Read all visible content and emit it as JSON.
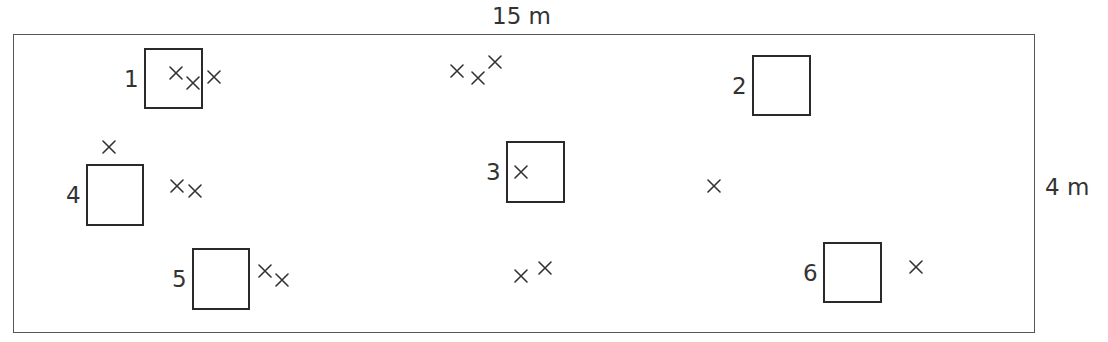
{
  "diagram": {
    "title": "",
    "colors": {
      "line": "#555555",
      "quadrat_border": "#2a2a2a",
      "text": "#333333",
      "background": "#ffffff"
    },
    "field": {
      "width_label": "15 m",
      "height_label": "4 m",
      "bounds_px": {
        "x": 13,
        "y": 34,
        "width": 1022,
        "height": 299
      }
    },
    "quadrats": [
      {
        "id": "1",
        "label": "1",
        "x": 144,
        "y": 48,
        "w": 59,
        "h": 61
      },
      {
        "id": "2",
        "label": "2",
        "x": 752,
        "y": 55,
        "w": 59,
        "h": 61
      },
      {
        "id": "3",
        "label": "3",
        "x": 506,
        "y": 141,
        "w": 59,
        "h": 62
      },
      {
        "id": "4",
        "label": "4",
        "x": 86,
        "y": 164,
        "w": 58,
        "h": 62
      },
      {
        "id": "5",
        "label": "5",
        "x": 192,
        "y": 248,
        "w": 58,
        "h": 62
      },
      {
        "id": "6",
        "label": "6",
        "x": 823,
        "y": 242,
        "w": 59,
        "h": 61
      }
    ],
    "marks": {
      "symbol": "×",
      "icon": "cross-mark-icon",
      "count": 17,
      "positions": [
        {
          "x": 176,
          "y": 73
        },
        {
          "x": 193,
          "y": 83
        },
        {
          "x": 214,
          "y": 77
        },
        {
          "x": 457,
          "y": 71
        },
        {
          "x": 478,
          "y": 78
        },
        {
          "x": 495,
          "y": 62
        },
        {
          "x": 109,
          "y": 147
        },
        {
          "x": 177,
          "y": 186
        },
        {
          "x": 195,
          "y": 191
        },
        {
          "x": 521,
          "y": 172
        },
        {
          "x": 714,
          "y": 186
        },
        {
          "x": 265,
          "y": 271
        },
        {
          "x": 282,
          "y": 280
        },
        {
          "x": 521,
          "y": 276
        },
        {
          "x": 545,
          "y": 268
        },
        {
          "x": 916,
          "y": 267
        }
      ]
    }
  }
}
